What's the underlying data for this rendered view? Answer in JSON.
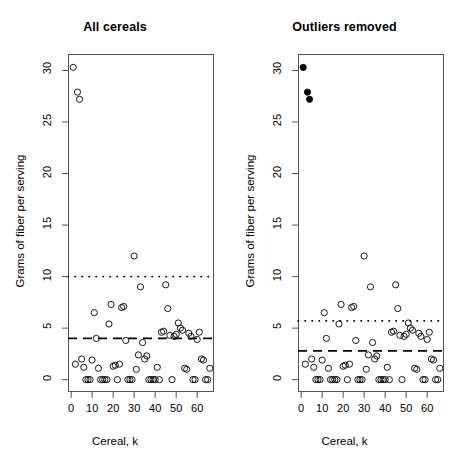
{
  "figure": {
    "width": 459,
    "height": 474,
    "background": "#ffffff",
    "foreground": "#000000",
    "axis_color": "#555555"
  },
  "chart_data": [
    {
      "type": "scatter",
      "panel": "left",
      "title": "All cereals",
      "xlabel": "Cereal,  k",
      "ylabel": "Grams of fiber per serving",
      "xlim": [
        -1.5,
        68
      ],
      "ylim": [
        -1.2,
        31.6
      ],
      "xticks": [
        0,
        10,
        20,
        30,
        40,
        50,
        60
      ],
      "yticks": [
        0,
        5,
        10,
        15,
        20,
        25,
        30
      ],
      "grid": false,
      "legend": "none",
      "marker": "open-circle",
      "reference_lines": [
        {
          "name": "dotted-threshold",
          "y": 10.0,
          "style": "dotted"
        },
        {
          "name": "dashed-mean",
          "y": 4.0,
          "style": "dashed"
        }
      ],
      "x": [
        1,
        2,
        3,
        4,
        5,
        6,
        7,
        8,
        9,
        10,
        11,
        12,
        13,
        14,
        15,
        16,
        17,
        18,
        19,
        20,
        21,
        22,
        23,
        24,
        25,
        26,
        27,
        28,
        29,
        30,
        31,
        32,
        33,
        34,
        35,
        36,
        37,
        38,
        39,
        40,
        41,
        42,
        43,
        44,
        45,
        46,
        47,
        48,
        49,
        50,
        51,
        52,
        53,
        54,
        55,
        56,
        57,
        58,
        59,
        60,
        61,
        62,
        63,
        64,
        65,
        66
      ],
      "y": [
        30.3,
        1.5,
        27.9,
        27.2,
        2.0,
        1.2,
        0.0,
        0.0,
        0.0,
        1.9,
        6.5,
        4.0,
        1.1,
        0.0,
        0.0,
        0.0,
        0.0,
        5.4,
        7.3,
        1.3,
        1.4,
        0.0,
        1.5,
        7.0,
        7.1,
        3.8,
        0.0,
        0.0,
        0.0,
        12.0,
        1.0,
        2.4,
        9.0,
        3.6,
        2.0,
        2.3,
        0.0,
        0.0,
        0.0,
        0.0,
        1.2,
        0.0,
        4.6,
        4.7,
        9.2,
        6.9,
        4.3,
        0.0,
        4.2,
        4.4,
        5.5,
        5.0,
        4.8,
        1.1,
        1.0,
        4.5,
        4.2,
        0.0,
        0.0,
        3.9,
        4.6,
        2.0,
        1.9,
        0.0,
        0.0,
        1.1
      ]
    },
    {
      "type": "scatter",
      "panel": "right",
      "title": "Outliers removed",
      "xlabel": "Cereal,  k",
      "ylabel": "Grams of fiber per serving",
      "xlim": [
        -1.5,
        68
      ],
      "ylim": [
        -1.2,
        31.6
      ],
      "xticks": [
        0,
        10,
        20,
        30,
        40,
        50,
        60
      ],
      "yticks": [
        0,
        5,
        10,
        15,
        20,
        25,
        30
      ],
      "grid": false,
      "legend": "none",
      "marker": "open-circle",
      "outlier_marker": "filled-circle",
      "outliers": [
        {
          "x": 1,
          "y": 30.3
        },
        {
          "x": 3,
          "y": 27.9
        },
        {
          "x": 4,
          "y": 27.2
        }
      ],
      "reference_lines": [
        {
          "name": "dotted-threshold",
          "y": 5.7,
          "style": "dotted"
        },
        {
          "name": "dashed-mean",
          "y": 2.8,
          "style": "dashed"
        }
      ],
      "x": [
        1,
        2,
        3,
        4,
        5,
        6,
        7,
        8,
        9,
        10,
        11,
        12,
        13,
        14,
        15,
        16,
        17,
        18,
        19,
        20,
        21,
        22,
        23,
        24,
        25,
        26,
        27,
        28,
        29,
        30,
        31,
        32,
        33,
        34,
        35,
        36,
        37,
        38,
        39,
        40,
        41,
        42,
        43,
        44,
        45,
        46,
        47,
        48,
        49,
        50,
        51,
        52,
        53,
        54,
        55,
        56,
        57,
        58,
        59,
        60,
        61,
        62,
        63,
        64,
        65,
        66
      ],
      "y": [
        30.3,
        1.5,
        27.9,
        27.2,
        2.0,
        1.2,
        0.0,
        0.0,
        0.0,
        1.9,
        6.5,
        4.0,
        1.1,
        0.0,
        0.0,
        0.0,
        0.0,
        5.4,
        7.3,
        1.3,
        1.4,
        0.0,
        1.5,
        7.0,
        7.1,
        3.8,
        0.0,
        0.0,
        0.0,
        12.0,
        1.0,
        2.4,
        9.0,
        3.6,
        2.0,
        2.3,
        0.0,
        0.0,
        0.0,
        0.0,
        1.2,
        0.0,
        4.6,
        4.7,
        9.2,
        6.9,
        4.3,
        0.0,
        4.2,
        4.4,
        5.5,
        5.0,
        4.8,
        1.1,
        1.0,
        4.5,
        4.2,
        0.0,
        0.0,
        3.9,
        4.6,
        2.0,
        1.9,
        0.0,
        0.0,
        1.1
      ]
    }
  ]
}
